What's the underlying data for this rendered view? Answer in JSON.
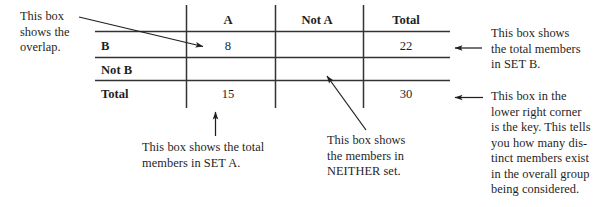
{
  "figure": {
    "kind": "two-way-frequency-table-diagram",
    "colors": {
      "ink": "#1f1f1f",
      "rule": "#333333",
      "background": "#ffffff"
    }
  },
  "table": {
    "column_headers": [
      "",
      "A",
      "Not A",
      "Total"
    ],
    "rows": [
      {
        "label": "B",
        "cells": [
          "8",
          "",
          "22"
        ]
      },
      {
        "label": "Not B",
        "cells": [
          "",
          "",
          ""
        ]
      },
      {
        "label": "Total",
        "cells": [
          "15",
          "",
          "30"
        ]
      }
    ]
  },
  "annotations": {
    "overlap": {
      "lines": [
        "This box",
        "shows the",
        "overlap."
      ]
    },
    "total_b": {
      "lines": [
        "This box shows",
        "the total members",
        "in SET B."
      ]
    },
    "key": {
      "lines": [
        "This box in the",
        "lower right corner",
        "is the key. This tells",
        "you how many dis-",
        "tinct members exist",
        "in the overall group",
        "being considered."
      ]
    },
    "total_a": {
      "lines": [
        "This box shows the total",
        "members in SET A."
      ]
    },
    "neither": {
      "lines": [
        "This box shows",
        "the members in",
        "NEITHER set."
      ]
    }
  }
}
